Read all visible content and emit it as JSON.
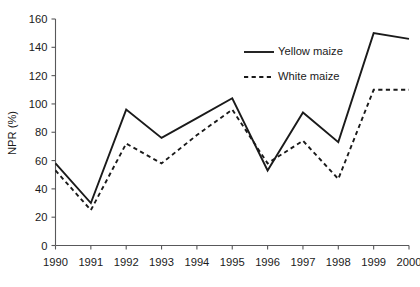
{
  "chart_data": {
    "type": "line",
    "title": "",
    "subtitle": "",
    "xlabel": "",
    "ylabel": "NPR (%)",
    "x": [
      1990,
      1991,
      1992,
      1993,
      1994,
      1995,
      1996,
      1997,
      1998,
      1999,
      2000
    ],
    "categories": [
      "1990",
      "1991",
      "1992",
      "1993",
      "1994",
      "1995",
      "1996",
      "1997",
      "1998",
      "1999",
      "2000"
    ],
    "xlim": [
      1990,
      2000
    ],
    "ylim": [
      0,
      160
    ],
    "ytick_labels": [
      "0",
      "20",
      "40",
      "60",
      "80",
      "100",
      "120",
      "140",
      "160"
    ],
    "yticks": [
      0,
      20,
      40,
      60,
      80,
      100,
      120,
      140,
      160
    ],
    "grid": false,
    "legend_position": "upper-right-inside",
    "series": [
      {
        "name": "Yellow maize",
        "style": "solid",
        "color": "#1a1a1a",
        "values": [
          58,
          30,
          96,
          76,
          90,
          104,
          53,
          94,
          73,
          150,
          146
        ]
      },
      {
        "name": "White maize",
        "style": "dashed",
        "color": "#1a1a1a",
        "values": [
          53,
          25,
          72,
          58,
          78,
          96,
          58,
          74,
          47,
          110,
          110
        ]
      }
    ]
  },
  "legend": {
    "items": [
      {
        "label": "Yellow maize",
        "style": "solid"
      },
      {
        "label": "White maize",
        "style": "dashed"
      }
    ]
  },
  "axis": {
    "y_title": "NPR (%)"
  }
}
